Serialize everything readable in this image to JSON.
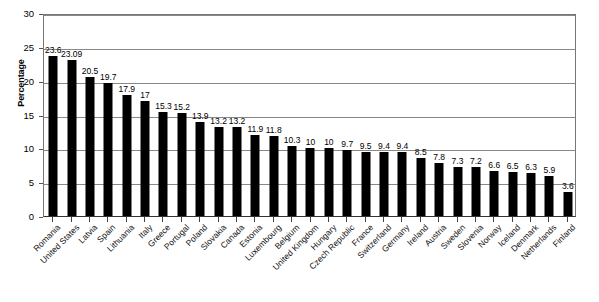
{
  "chart_data": {
    "type": "bar",
    "title": "",
    "xlabel": "",
    "ylabel": "Percentage",
    "ylim": [
      0,
      30
    ],
    "ytick_step": 5,
    "yticks": [
      0,
      5,
      10,
      15,
      20,
      25,
      30
    ],
    "ytick_labels": [
      "0",
      "5",
      "10",
      "15",
      "20",
      "25",
      "30"
    ],
    "grid": true,
    "grid_axis": "y",
    "legend": false,
    "bar_color": "#000000",
    "background_color": "#FFFFFF",
    "gridline_color": "#888888",
    "axis_color": "#333333",
    "data_labels": true,
    "categories": [
      "Romania",
      "United States",
      "Latvia",
      "Spain",
      "Lithuania",
      "Italy",
      "Greece",
      "Portugal",
      "Poland",
      "Slovakia",
      "Canada",
      "Estonia",
      "Luxembourg",
      "Belgium",
      "United Kingdom",
      "Hungary",
      "Czech Republic",
      "France",
      "Switzerland",
      "Germany",
      "Ireland",
      "Austria",
      "Sweden",
      "Slovenia",
      "Norway",
      "Iceland",
      "Denmark",
      "Netherlands",
      "Finland"
    ],
    "values": [
      23.6,
      23.09,
      20.5,
      19.7,
      17.9,
      17,
      15.3,
      15.2,
      13.9,
      13.2,
      13.2,
      11.9,
      11.8,
      10.3,
      10,
      10,
      9.7,
      9.5,
      9.4,
      9.4,
      8.5,
      7.8,
      7.3,
      7.2,
      6.6,
      6.5,
      6.3,
      5.9,
      3.6
    ],
    "value_labels": [
      "23.6",
      "23.09",
      "20.5",
      "19.7",
      "17.9",
      "17",
      "15.3",
      "15.2",
      "13.9",
      "13.2",
      "13.2",
      "11.9",
      "11.8",
      "10.3",
      "10",
      "10",
      "9.7",
      "9.5",
      "9.4",
      "9.4",
      "8.5",
      "7.8",
      "7.3",
      "7.2",
      "6.6",
      "6.5",
      "6.3",
      "5.9",
      "3.6"
    ]
  }
}
